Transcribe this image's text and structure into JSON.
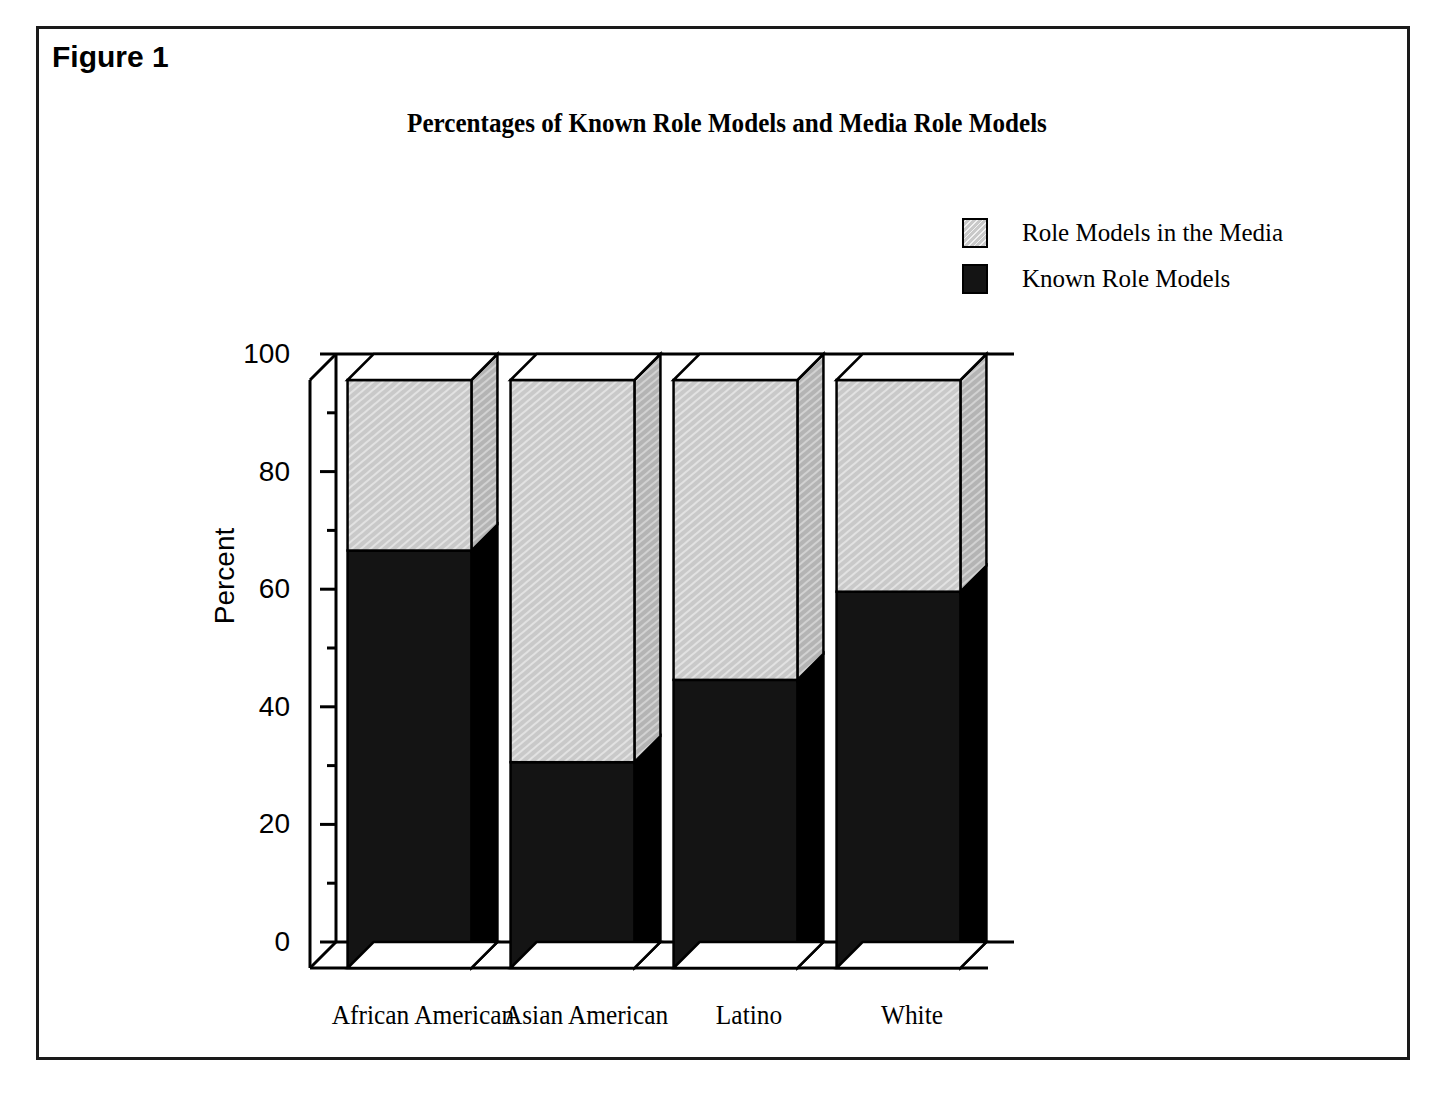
{
  "figure": {
    "caption": "Figure 1"
  },
  "chart_data": {
    "type": "bar",
    "subtype": "stacked-100-percent-3d",
    "title": "Percentages of Known Role Models and Media Role Models",
    "xlabel": "",
    "ylabel": "Percent",
    "ylim": [
      0,
      100
    ],
    "ytick_labels": [
      "0",
      "20",
      "40",
      "60",
      "80",
      "100"
    ],
    "ytick_values": [
      0,
      20,
      40,
      60,
      80,
      100
    ],
    "yminor_values": [
      10,
      30,
      50,
      70,
      90
    ],
    "grid": false,
    "legend_position": "top-right",
    "categories": [
      "African American",
      "Asian American",
      "Latino",
      "White"
    ],
    "series": [
      {
        "name": "Role Models in the Media",
        "color": "#c9c9c9",
        "values": [
          29,
          65,
          51,
          36
        ]
      },
      {
        "name": "Known Role Models",
        "color": "#141414",
        "values": [
          71,
          35,
          49,
          64
        ]
      }
    ]
  },
  "legend": {
    "items": [
      {
        "label": "Role Models in the Media",
        "swatch": "media-swatch"
      },
      {
        "label": "Known Role Models",
        "swatch": "known-swatch"
      }
    ]
  },
  "colors": {
    "media": "#c9c9c9",
    "known": "#141414",
    "axis": "#000000",
    "background": "#ffffff"
  }
}
